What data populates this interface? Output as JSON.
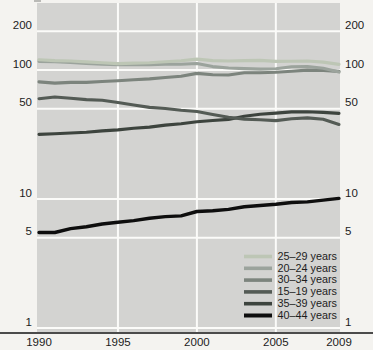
{
  "figure": {
    "background": "#f4f3f0",
    "plot_background": "#d3d3d1",
    "gridline_color": "#fbfbf9",
    "axis_line_color": "#4b4b4b",
    "text_color": "#1c1c1c"
  },
  "chart_data": {
    "type": "line",
    "title": "",
    "xlabel": "",
    "ylabel": "",
    "yscale": "log",
    "ylim": [
      1,
      250
    ],
    "xlim": [
      1990,
      2009
    ],
    "grid": true,
    "legend_position": "inside-bottom-right",
    "ytick_label_sides": "both",
    "xticks": [
      1990,
      1995,
      2000,
      2005,
      2009
    ],
    "yticks": [
      200,
      100,
      50,
      10,
      5,
      1
    ],
    "x": [
      1990,
      1991,
      1992,
      1993,
      1994,
      1995,
      1996,
      1997,
      1998,
      1999,
      2000,
      2001,
      2002,
      2003,
      2004,
      2005,
      2006,
      2007,
      2008,
      2009
    ],
    "series": [
      {
        "name": "25–29 years",
        "color": "#bdc6b5",
        "values": [
          120.2,
          118.2,
          117.4,
          115.5,
          113.9,
          112.2,
          113.1,
          113.8,
          115.9,
          117.8,
          121.4,
          118.2,
          117.4,
          118.3,
          118.6,
          116.5,
          116.7,
          117.5,
          115.1,
          110.5
        ]
      },
      {
        "name": "20–24 years",
        "color": "#9ba39c",
        "values": [
          116.5,
          115.7,
          114.6,
          112.6,
          111.1,
          109.8,
          110.4,
          110.1,
          111.2,
          111.0,
          112.3,
          106.2,
          103.6,
          102.6,
          101.7,
          102.2,
          105.9,
          106.4,
          103.0,
          96.3
        ]
      },
      {
        "name": "30–34 years",
        "color": "#7c847d",
        "values": [
          80.8,
          79.2,
          80.2,
          80.2,
          81.5,
          82.5,
          83.9,
          85.3,
          87.4,
          89.6,
          94.1,
          91.9,
          91.5,
          95.1,
          95.3,
          95.9,
          97.7,
          99.9,
          99.3,
          97.5
        ]
      },
      {
        "name": "15–19 years",
        "color": "#545b55",
        "values": [
          59.9,
          61.8,
          60.3,
          59.0,
          58.2,
          56.0,
          53.5,
          51.3,
          50.3,
          48.8,
          47.7,
          45.3,
          43.0,
          41.6,
          41.1,
          40.5,
          41.9,
          42.5,
          41.5,
          37.9
        ]
      },
      {
        "name": "35–39 years",
        "color": "#3d443e",
        "values": [
          31.7,
          32.0,
          32.5,
          32.9,
          33.7,
          34.3,
          35.3,
          36.1,
          37.4,
          38.3,
          39.7,
          40.6,
          41.4,
          43.8,
          45.4,
          46.3,
          47.3,
          47.5,
          46.9,
          46.1
        ]
      },
      {
        "name": "40–44 years",
        "color": "#0e0e0e",
        "values": [
          5.5,
          5.5,
          5.9,
          6.1,
          6.4,
          6.6,
          6.8,
          7.1,
          7.3,
          7.4,
          8.0,
          8.1,
          8.3,
          8.7,
          8.9,
          9.1,
          9.4,
          9.5,
          9.8,
          10.1
        ]
      }
    ]
  }
}
